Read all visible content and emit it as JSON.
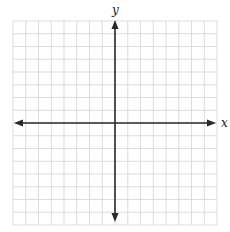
{
  "chart_data": {
    "type": "coordinate-grid",
    "title": "",
    "xlabel": "x",
    "ylabel": "y",
    "xlim": [
      -8,
      8
    ],
    "ylim": [
      -8,
      8
    ],
    "grid": true,
    "grid_step": 1,
    "tick_labels": [],
    "series": [],
    "arrows": {
      "x_axis": "both-ends",
      "y_axis": "both-ends"
    },
    "legend": null
  },
  "labels": {
    "x_axis": "x",
    "y_axis": "y"
  },
  "colors": {
    "background": "#ffffff",
    "grid": "#d4d4d4",
    "axis": "#2a2a2a",
    "label": "#222222"
  }
}
